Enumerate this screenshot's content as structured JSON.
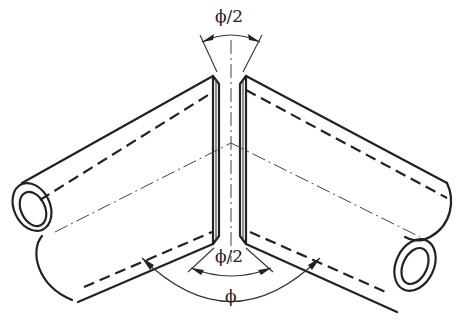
{
  "figure": {
    "labels": {
      "top_angle": "ϕ/2",
      "bottom_inner_angle": "ϕ/2",
      "bottom_outer_angle": "ϕ"
    },
    "colors": {
      "line": "#222222",
      "background": "#ffffff"
    },
    "parts": [
      "left-pipe",
      "right-pipe",
      "miter-gap",
      "center-axis",
      "angle-dimensions"
    ]
  }
}
